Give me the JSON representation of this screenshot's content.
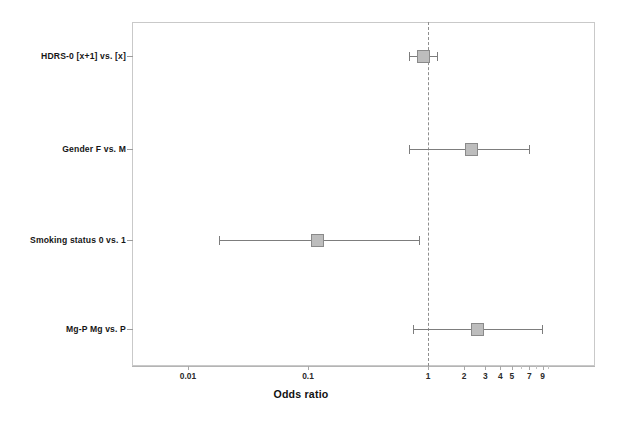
{
  "chart_data": {
    "type": "forest",
    "title": "",
    "xlabel": "Odds ratio",
    "ylabel": "",
    "xscale": "log",
    "xlim": [
      0.005,
      11
    ],
    "reference_line": 1,
    "grid": false,
    "legend": null,
    "xticks": [
      {
        "value": 0.01,
        "label": "0.01",
        "major": true
      },
      {
        "value": 0.1,
        "label": "0.1",
        "major": true
      },
      {
        "value": 1,
        "label": "1",
        "major": true
      },
      {
        "value": 2,
        "label": "2",
        "major": true
      },
      {
        "value": 3,
        "label": "3",
        "major": true
      },
      {
        "value": 4,
        "label": "4",
        "major": true
      },
      {
        "value": 5,
        "label": "5",
        "major": true
      },
      {
        "value": 6,
        "label": "",
        "major": false
      },
      {
        "value": 7,
        "label": "7",
        "major": true
      },
      {
        "value": 8,
        "label": "",
        "major": false
      },
      {
        "value": 9,
        "label": "9",
        "major": true
      },
      {
        "value": 10,
        "label": "",
        "major": false
      }
    ],
    "categories": [
      "HDRS-0 [x+1] vs. [x]",
      "Gender F vs. M",
      "Smoking status  0 vs. 1",
      "Mg-P  Mg vs. P"
    ],
    "points": [
      {
        "label": "HDRS-0 [x+1] vs. [x]",
        "or": 0.91,
        "ci_low": 0.7,
        "ci_high": 1.21
      },
      {
        "label": "Gender F vs. M",
        "or": 2.3,
        "ci_low": 0.7,
        "ci_high": 7.1
      },
      {
        "label": "Smoking status  0 vs. 1",
        "or": 0.12,
        "ci_low": 0.018,
        "ci_high": 0.86
      },
      {
        "label": "Mg-P  Mg vs. P",
        "or": 2.6,
        "ci_low": 0.75,
        "ci_high": 9.1
      }
    ],
    "colors": {
      "marker_fill": "#bdbdbd",
      "marker_edge": "#8a8a8a",
      "ci_line": "#7d7d7d",
      "reference_line": "#8e8e8e",
      "frame": "#c9c9c9",
      "background": "#ffffff",
      "text": "#161616"
    }
  },
  "rows": {
    "r0": {
      "label": "HDRS-0 [x+1] vs. [x]"
    },
    "r1": {
      "label": "Gender F vs. M"
    },
    "r2": {
      "label": "Smoking status  0 vs. 1"
    },
    "r3": {
      "label": "Mg-P  Mg vs. P"
    }
  },
  "axis": {
    "title": "Odds ratio",
    "t0": "0.01",
    "t1": "0.1",
    "t2": "1",
    "t3": "2",
    "t4": "3",
    "t5": "4",
    "t6": "5",
    "t7": "7",
    "t8": "9"
  }
}
